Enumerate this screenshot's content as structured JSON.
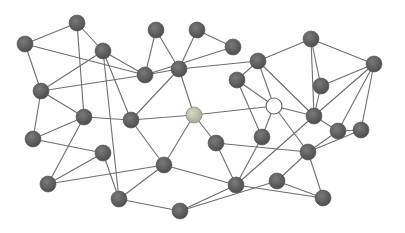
{
  "diagram": {
    "type": "network-graph",
    "canvas": {
      "width": 405,
      "height": 233,
      "background": "#ffffff"
    },
    "colors": {
      "node_dark": "#5f5f5f",
      "node_light": "#c8c8b0",
      "node_hollow": "#ffffff",
      "edge": "#6e6e6e"
    },
    "node_radius": 8,
    "nodes": [
      {
        "id": "A",
        "x": 77,
        "y": 23,
        "style": "dark"
      },
      {
        "id": "B",
        "x": 25,
        "y": 44,
        "style": "dark"
      },
      {
        "id": "C",
        "x": 103,
        "y": 51,
        "style": "dark"
      },
      {
        "id": "D",
        "x": 156,
        "y": 30,
        "style": "dark"
      },
      {
        "id": "E",
        "x": 197,
        "y": 30,
        "style": "dark"
      },
      {
        "id": "F",
        "x": 233,
        "y": 47,
        "style": "dark"
      },
      {
        "id": "G",
        "x": 145,
        "y": 75,
        "style": "dark"
      },
      {
        "id": "H",
        "x": 179,
        "y": 69,
        "style": "dark"
      },
      {
        "id": "I",
        "x": 258,
        "y": 61,
        "style": "dark"
      },
      {
        "id": "J",
        "x": 311,
        "y": 39,
        "style": "dark"
      },
      {
        "id": "K",
        "x": 374,
        "y": 64,
        "style": "dark"
      },
      {
        "id": "L",
        "x": 237,
        "y": 80,
        "style": "dark"
      },
      {
        "id": "M",
        "x": 321,
        "y": 86,
        "style": "dark"
      },
      {
        "id": "N",
        "x": 41,
        "y": 91,
        "style": "dark"
      },
      {
        "id": "O",
        "x": 84,
        "y": 117,
        "style": "dark"
      },
      {
        "id": "P",
        "x": 131,
        "y": 120,
        "style": "dark"
      },
      {
        "id": "Q",
        "x": 194,
        "y": 115,
        "style": "light"
      },
      {
        "id": "R",
        "x": 274,
        "y": 106,
        "style": "hollow"
      },
      {
        "id": "S",
        "x": 314,
        "y": 116,
        "style": "dark"
      },
      {
        "id": "T",
        "x": 33,
        "y": 139,
        "style": "dark"
      },
      {
        "id": "U",
        "x": 103,
        "y": 153,
        "style": "dark"
      },
      {
        "id": "V",
        "x": 216,
        "y": 143,
        "style": "dark"
      },
      {
        "id": "W",
        "x": 262,
        "y": 137,
        "style": "dark"
      },
      {
        "id": "X",
        "x": 338,
        "y": 131,
        "style": "dark"
      },
      {
        "id": "Y",
        "x": 361,
        "y": 130,
        "style": "dark"
      },
      {
        "id": "Z",
        "x": 164,
        "y": 165,
        "style": "dark"
      },
      {
        "id": "AA",
        "x": 308,
        "y": 152,
        "style": "dark"
      },
      {
        "id": "AB",
        "x": 48,
        "y": 184,
        "style": "dark"
      },
      {
        "id": "AC",
        "x": 119,
        "y": 199,
        "style": "dark"
      },
      {
        "id": "AD",
        "x": 236,
        "y": 185,
        "style": "dark"
      },
      {
        "id": "AE",
        "x": 277,
        "y": 181,
        "style": "dark"
      },
      {
        "id": "AF",
        "x": 180,
        "y": 211,
        "style": "dark"
      },
      {
        "id": "AG",
        "x": 323,
        "y": 198,
        "style": "dark"
      }
    ],
    "edges": [
      [
        "A",
        "B"
      ],
      [
        "A",
        "C"
      ],
      [
        "A",
        "O"
      ],
      [
        "B",
        "N"
      ],
      [
        "B",
        "G"
      ],
      [
        "C",
        "G"
      ],
      [
        "C",
        "N"
      ],
      [
        "C",
        "P"
      ],
      [
        "C",
        "AC"
      ],
      [
        "D",
        "G"
      ],
      [
        "D",
        "H"
      ],
      [
        "E",
        "H"
      ],
      [
        "E",
        "F"
      ],
      [
        "F",
        "G"
      ],
      [
        "G",
        "H"
      ],
      [
        "G",
        "N"
      ],
      [
        "H",
        "I"
      ],
      [
        "H",
        "P"
      ],
      [
        "H",
        "Q"
      ],
      [
        "I",
        "J"
      ],
      [
        "I",
        "L"
      ],
      [
        "I",
        "R"
      ],
      [
        "I",
        "S"
      ],
      [
        "J",
        "K"
      ],
      [
        "J",
        "M"
      ],
      [
        "J",
        "S"
      ],
      [
        "K",
        "M"
      ],
      [
        "K",
        "S"
      ],
      [
        "K",
        "X"
      ],
      [
        "K",
        "Y"
      ],
      [
        "L",
        "R"
      ],
      [
        "L",
        "W"
      ],
      [
        "M",
        "S"
      ],
      [
        "N",
        "O"
      ],
      [
        "N",
        "T"
      ],
      [
        "O",
        "P"
      ],
      [
        "O",
        "T"
      ],
      [
        "O",
        "AB"
      ],
      [
        "P",
        "Q"
      ],
      [
        "P",
        "Z"
      ],
      [
        "Q",
        "R"
      ],
      [
        "Q",
        "V"
      ],
      [
        "Q",
        "Z"
      ],
      [
        "R",
        "S"
      ],
      [
        "R",
        "W"
      ],
      [
        "R",
        "AA"
      ],
      [
        "S",
        "X"
      ],
      [
        "S",
        "AD"
      ],
      [
        "T",
        "U"
      ],
      [
        "U",
        "AB"
      ],
      [
        "U",
        "AC"
      ],
      [
        "V",
        "AD"
      ],
      [
        "V",
        "AA"
      ],
      [
        "W",
        "AD"
      ],
      [
        "X",
        "Y"
      ],
      [
        "X",
        "AA"
      ],
      [
        "Y",
        "AA"
      ],
      [
        "Z",
        "AB"
      ],
      [
        "Z",
        "AC"
      ],
      [
        "Z",
        "AD"
      ],
      [
        "AA",
        "AE"
      ],
      [
        "AA",
        "AG"
      ],
      [
        "AD",
        "AF"
      ],
      [
        "AD",
        "AG"
      ],
      [
        "AE",
        "AF"
      ],
      [
        "AE",
        "AG"
      ],
      [
        "AF",
        "AC"
      ]
    ]
  }
}
